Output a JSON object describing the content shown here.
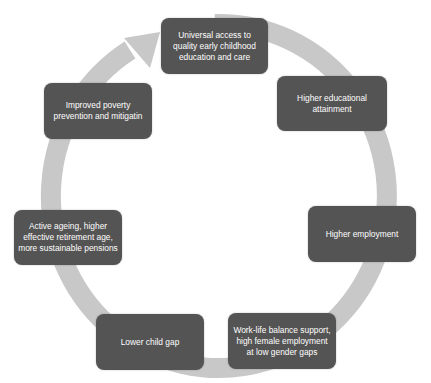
{
  "diagram": {
    "type": "cycle",
    "ring_color": "#c8c8c8",
    "box_color": "#545454",
    "text_color": "#ffffff",
    "nodes": [
      {
        "id": "n1",
        "label": "Universal access to quality early childhood education and care"
      },
      {
        "id": "n2",
        "label": "Higher educational attainment"
      },
      {
        "id": "n3",
        "label": "Higher employment"
      },
      {
        "id": "n4",
        "label": "Work-life balance support, high female employment at low gender gaps"
      },
      {
        "id": "n5",
        "label": "Lower child gap"
      },
      {
        "id": "n6",
        "label": "Active ageing, higher effective retirement age, more sustainable pensions"
      },
      {
        "id": "n7",
        "label": "Improved poverty prevention and mitigatin"
      }
    ],
    "flow": "clockwise, arrow returns from node 7 to node 1"
  }
}
